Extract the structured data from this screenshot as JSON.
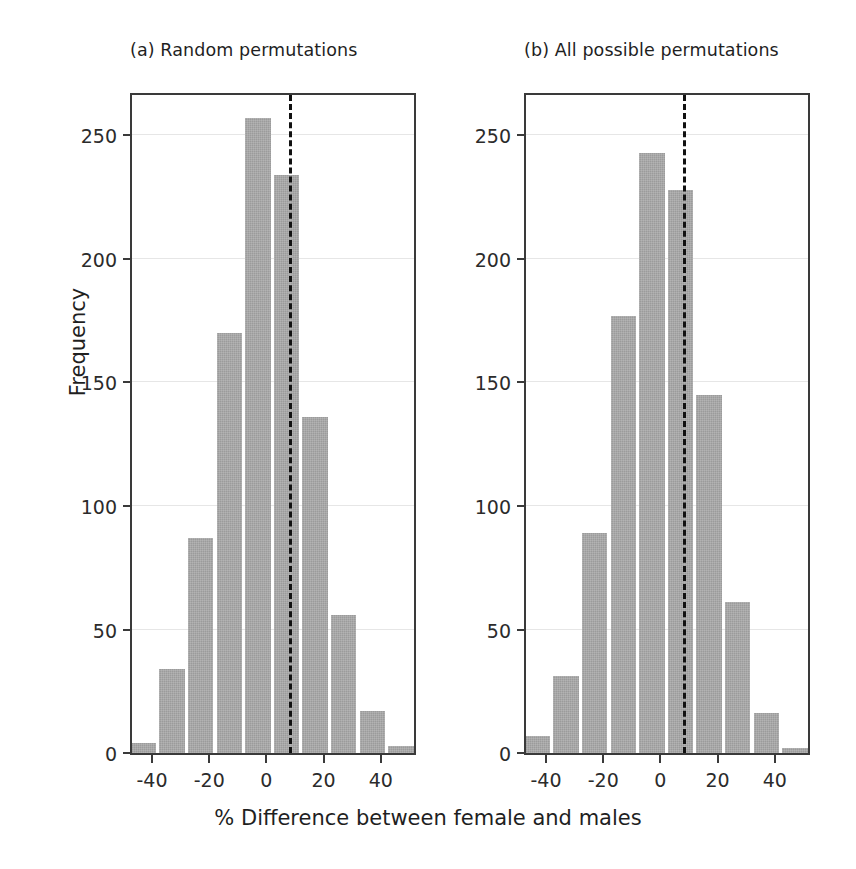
{
  "figure": {
    "xlabel": "% Difference between female and males",
    "ylabel": "Frequency",
    "bar_color": "#9b9b9b",
    "refline_color": "#111111",
    "axis_color": "#3a3a3a",
    "gridline_color": "#e6e6e6"
  },
  "panels": [
    {
      "id": "a",
      "title": "(a) Random permutations",
      "chart_data": {
        "type": "bar",
        "title": "(a) Random permutations",
        "xlabel": "% Difference between female and males",
        "ylabel": "Frequency",
        "xlim": [
          -47,
          53
        ],
        "ylim": [
          0,
          268
        ],
        "xticks": [
          -40,
          -20,
          0,
          20,
          40
        ],
        "xticklabels": [
          "-40",
          "-20",
          "0",
          "20",
          "40"
        ],
        "yticks": [
          0,
          50,
          100,
          150,
          200,
          250
        ],
        "yticklabels": [
          "0",
          "50",
          "100",
          "150",
          "200",
          "250"
        ],
        "grid": "horizontal",
        "legend": "none",
        "bin_width": 10,
        "bin_centers": [
          -43,
          -33,
          -23,
          -13,
          -3,
          7,
          17,
          27,
          37,
          47
        ],
        "categories": [
          "-48 to -38",
          "-38 to -28",
          "-28 to -18",
          "-18 to -8",
          "-8 to 2",
          "2 to 12",
          "12 to 22",
          "22 to 32",
          "32 to 42",
          "42 to 52"
        ],
        "values": [
          4,
          34,
          87,
          170,
          257,
          234,
          136,
          56,
          17,
          3
        ],
        "annotations": [
          {
            "type": "vline",
            "style": "dashed",
            "x": 8,
            "label": "observed difference"
          }
        ]
      }
    },
    {
      "id": "b",
      "title": "(b) All possible permutations",
      "chart_data": {
        "type": "bar",
        "title": "(b) All possible permutations",
        "xlabel": "% Difference between female and males",
        "ylabel": "Frequency",
        "xlim": [
          -47,
          53
        ],
        "ylim": [
          0,
          268
        ],
        "xticks": [
          -40,
          -20,
          0,
          20,
          40
        ],
        "xticklabels": [
          "-40",
          "-20",
          "0",
          "20",
          "40"
        ],
        "yticks": [
          0,
          50,
          100,
          150,
          200,
          250
        ],
        "yticklabels": [
          "0",
          "50",
          "100",
          "150",
          "200",
          "250"
        ],
        "grid": "horizontal",
        "legend": "none",
        "bin_width": 10,
        "bin_centers": [
          -43,
          -33,
          -23,
          -13,
          -3,
          7,
          17,
          27,
          37,
          47
        ],
        "categories": [
          "-48 to -38",
          "-38 to -28",
          "-28 to -18",
          "-18 to -8",
          "-8 to 2",
          "2 to 12",
          "12 to 22",
          "22 to 32",
          "32 to 42",
          "42 to 52"
        ],
        "values": [
          7,
          31,
          89,
          177,
          243,
          228,
          145,
          61,
          16,
          2
        ],
        "annotations": [
          {
            "type": "vline",
            "style": "dashed",
            "x": 8,
            "label": "observed difference"
          }
        ]
      }
    }
  ],
  "chart_data": [
    {
      "type": "bar",
      "title": "(a) Random permutations",
      "xlabel": "% Difference between female and males",
      "ylabel": "Frequency",
      "categories": [
        "-43",
        "-33",
        "-23",
        "-13",
        "-3",
        "7",
        "17",
        "27",
        "37",
        "47"
      ],
      "values": [
        4,
        34,
        87,
        170,
        257,
        234,
        136,
        56,
        17,
        3
      ],
      "xlim": [
        -47,
        53
      ],
      "ylim": [
        0,
        268
      ],
      "xticks": [
        -40,
        -20,
        0,
        20,
        40
      ],
      "yticks": [
        0,
        50,
        100,
        150,
        200,
        250
      ],
      "grid": "horizontal",
      "legend": "none",
      "annotations": [
        {
          "type": "vline",
          "style": "dashed",
          "x": 8
        }
      ]
    },
    {
      "type": "bar",
      "title": "(b) All possible permutations",
      "xlabel": "% Difference between female and males",
      "ylabel": "Frequency",
      "categories": [
        "-43",
        "-33",
        "-23",
        "-13",
        "-3",
        "7",
        "17",
        "27",
        "37",
        "47"
      ],
      "values": [
        7,
        31,
        89,
        177,
        243,
        228,
        145,
        61,
        16,
        2
      ],
      "xlim": [
        -47,
        53
      ],
      "ylim": [
        0,
        268
      ],
      "xticks": [
        -40,
        -20,
        0,
        20,
        40
      ],
      "yticks": [
        0,
        50,
        100,
        150,
        200,
        250
      ],
      "grid": "horizontal",
      "legend": "none",
      "annotations": [
        {
          "type": "vline",
          "style": "dashed",
          "x": 8
        }
      ]
    }
  ]
}
